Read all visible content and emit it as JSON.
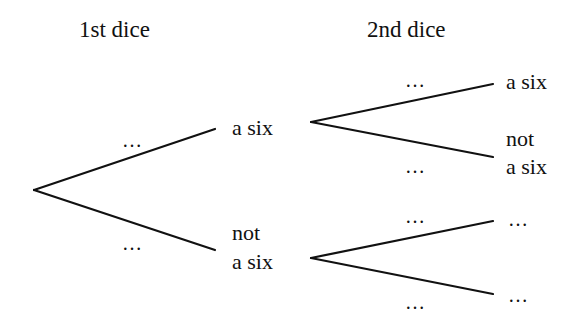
{
  "headers": {
    "first": "1st dice",
    "second": "2nd dice"
  },
  "first_branches": {
    "upper": {
      "prob": "…",
      "outcome": "a six"
    },
    "lower": {
      "prob": "…",
      "outcome_line1": "not",
      "outcome_line2": "a six"
    }
  },
  "second_after_six": {
    "upper": {
      "prob": "…",
      "outcome": "a six"
    },
    "lower": {
      "prob": "…",
      "outcome_line1": "not",
      "outcome_line2": "a six"
    }
  },
  "second_after_not_six": {
    "upper": {
      "prob": "…",
      "outcome": "…"
    },
    "lower": {
      "prob": "…",
      "outcome": "…"
    }
  },
  "colors": {
    "line": "#111111",
    "background": "#ffffff"
  }
}
